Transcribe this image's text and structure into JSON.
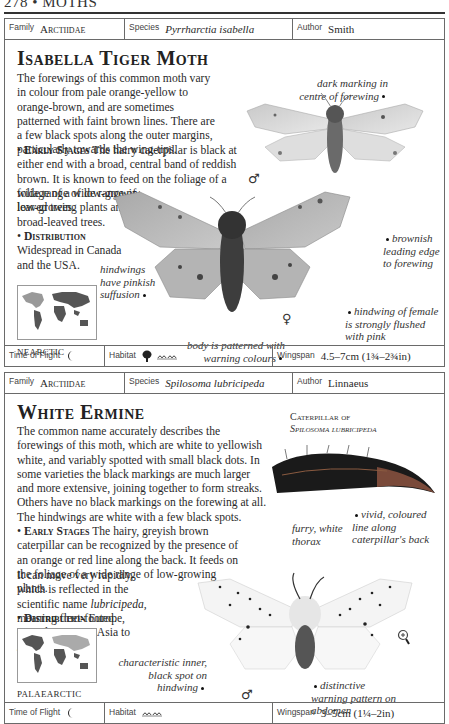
{
  "page": {
    "header": "278 • MOTHS"
  },
  "entries": [
    {
      "family_label": "Family",
      "family": "Arctiidae",
      "species_label": "Species",
      "species": "Pyrrharctia isabella",
      "author_label": "Author",
      "author": "Smith",
      "title": "Isabella Tiger Moth",
      "description": "The forewings of this common moth vary in colour from pale orange-yellow to orange-brown, and are sometimes patterned with faint brown lines. There are a few black spots along the outer margins, particularly towards the wing-tips.",
      "early_stages_heading": "Early Stages",
      "early_stages": "The hairy caterpillar is black at either end with a broad, central band of reddish brown. It is known to feed on the foliage of a wide range of low-growing plants and broad-leaved trees.",
      "distribution_heading": "Distribution",
      "distribution": "Widespread in Canada and the USA.",
      "map_label": "NEARCTIC",
      "captions": {
        "dark_marking": "dark marking in centre of forewing",
        "brownish_edge": "brownish leading edge to forewing",
        "hindwings_pinkish": "hindwings have pinkish suffusion",
        "hindwing_female": "hindwing of female is strongly flushed with pink",
        "body_patterned": "body is patterned with warning colours"
      },
      "male_symbol": "♂",
      "female_symbol": "♀",
      "time_of_flight_label": "Time of Flight",
      "time_of_flight_icon": "moon-icon",
      "habitat_label": "Habitat",
      "habitat_icons": [
        "tree-icon",
        "grassland-icon"
      ],
      "wingspan_label": "Wingspan",
      "wingspan": "4.5–7cm (1¾–2¾in)"
    },
    {
      "family_label": "Family",
      "family": "Arctiidae",
      "species_label": "Species",
      "species": "Spilosoma lubricipeda",
      "author_label": "Author",
      "author": "Linnaeus",
      "title": "White Ermine",
      "description": "The common name accurately describes the forewings of this moth, which are white to yellowish white, and variably spotted with small black dots. In some varieties the black markings are much larger and more extensive, joining together to form streaks. Others have no black markings on the forewing at all. The hindwings are white with a few black spots.",
      "early_stages_heading": "Early Stages",
      "early_stages": "The hairy, greyish brown caterpillar can be recognized by the presence of an orange or red line along the back. It feeds on the foliage of a wide range of low-growing plants.",
      "early_stages_extra_1": "It can move very rapidly, which is reflected in the scientific name",
      "early_stages_extra_italic": "lubricipeda",
      "early_stages_extra_2": ", meaning fleet-footed.",
      "distribution_heading": "Distribution",
      "distribution": "Europe, extending across Asia to Japan.",
      "map_label": "PALAEARCTIC",
      "caterpillar_heading_1": "Caterpillar of",
      "caterpillar_heading_2": "Spilosoma lubricipeda",
      "captions": {
        "vivid_line": "vivid, coloured line along caterpillar's back",
        "furry_thorax": "furry, white thorax",
        "inner_spot": "characteristic inner, black spot on hindwing",
        "warning_pattern": "distinctive warning pattern on abdomen"
      },
      "male_symbol": "♂",
      "magnifier_icon": "magnifier-icon",
      "time_of_flight_label": "Time of Flight",
      "time_of_flight_icon": "moon-icon",
      "habitat_label": "Habitat",
      "habitat_icons": [
        "grassland-icon"
      ],
      "wingspan_label": "Wingspan",
      "wingspan": "3–5cm (1¼–2in)"
    }
  ]
}
